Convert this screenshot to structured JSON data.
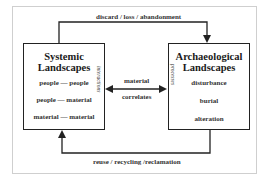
{
  "diagram": {
    "top_flow_label": "discard / loss / abandonment",
    "bottom_flow_label": "reuse / recycling /reclamation",
    "middle_label_line1": "material",
    "middle_label_line2": "correlates",
    "left_box": {
      "title_line1": "Systemic",
      "title_line2": "Landscapes",
      "side_label": "interactions",
      "items": [
        "people — people",
        "people — material",
        "material — material"
      ]
    },
    "right_box": {
      "title_line1": "Archaeological",
      "title_line2": "Landscapes",
      "side_label": "processes",
      "items": [
        "disturbance",
        "burial",
        "alteration"
      ]
    }
  }
}
